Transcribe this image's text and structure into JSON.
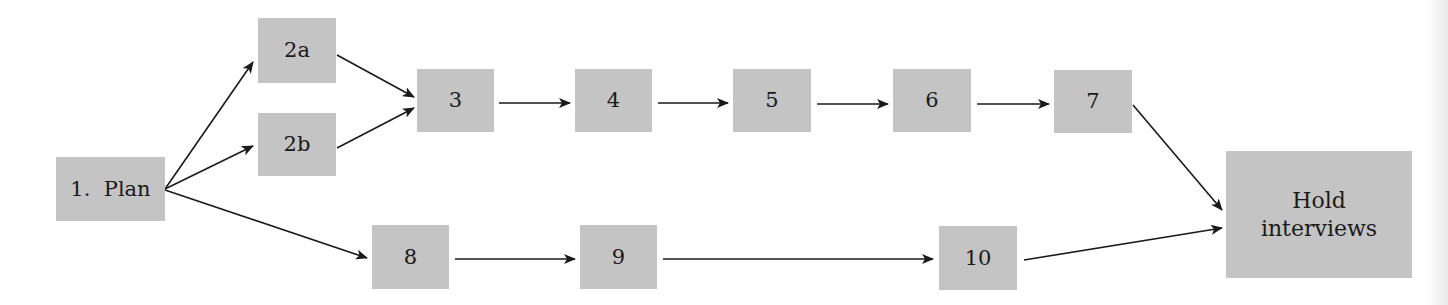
{
  "diagram": {
    "type": "flowchart",
    "nodes": [
      {
        "id": "plan",
        "label": "1.  Plan",
        "x": 56,
        "y": 157,
        "w": 109,
        "h": 64
      },
      {
        "id": "2a",
        "label": "2a",
        "x": 258,
        "y": 18,
        "w": 78,
        "h": 65
      },
      {
        "id": "2b",
        "label": "2b",
        "x": 258,
        "y": 113,
        "w": 78,
        "h": 63
      },
      {
        "id": "3",
        "label": "3",
        "x": 417,
        "y": 69,
        "w": 77,
        "h": 63
      },
      {
        "id": "4",
        "label": "4",
        "x": 575,
        "y": 69,
        "w": 77,
        "h": 63
      },
      {
        "id": "5",
        "label": "5",
        "x": 733,
        "y": 69,
        "w": 78,
        "h": 63
      },
      {
        "id": "6",
        "label": "6",
        "x": 893,
        "y": 69,
        "w": 78,
        "h": 63
      },
      {
        "id": "7",
        "label": "7",
        "x": 1054,
        "y": 70,
        "w": 78,
        "h": 63
      },
      {
        "id": "hold",
        "label_line1": "Hold",
        "label_line2": "interviews",
        "x": 1226,
        "y": 151,
        "w": 186,
        "h": 127
      },
      {
        "id": "8",
        "label": "8",
        "x": 372,
        "y": 225,
        "w": 77,
        "h": 64
      },
      {
        "id": "9",
        "label": "9",
        "x": 580,
        "y": 225,
        "w": 77,
        "h": 64
      },
      {
        "id": "10",
        "label": "10",
        "x": 939,
        "y": 226,
        "w": 78,
        "h": 64
      }
    ],
    "edges": [
      {
        "from": "plan",
        "to": "2a",
        "x1": 165,
        "y1": 189,
        "x2": 253,
        "y2": 62
      },
      {
        "from": "plan",
        "to": "2b",
        "x1": 165,
        "y1": 189,
        "x2": 253,
        "y2": 146
      },
      {
        "from": "plan",
        "to": "8",
        "x1": 165,
        "y1": 190,
        "x2": 367,
        "y2": 258
      },
      {
        "from": "2a",
        "to": "3",
        "x1": 337,
        "y1": 55,
        "x2": 414,
        "y2": 97
      },
      {
        "from": "2b",
        "to": "3",
        "x1": 337,
        "y1": 148,
        "x2": 414,
        "y2": 108
      },
      {
        "from": "3",
        "to": "4",
        "x1": 499,
        "y1": 103,
        "x2": 570,
        "y2": 103
      },
      {
        "from": "4",
        "to": "5",
        "x1": 658,
        "y1": 103,
        "x2": 728,
        "y2": 103
      },
      {
        "from": "5",
        "to": "6",
        "x1": 817,
        "y1": 104,
        "x2": 888,
        "y2": 104
      },
      {
        "from": "6",
        "to": "7",
        "x1": 977,
        "y1": 104,
        "x2": 1049,
        "y2": 104
      },
      {
        "from": "7",
        "to": "hold",
        "x1": 1133,
        "y1": 105,
        "x2": 1222,
        "y2": 210
      },
      {
        "from": "8",
        "to": "9",
        "x1": 455,
        "y1": 259,
        "x2": 575,
        "y2": 259
      },
      {
        "from": "9",
        "to": "10",
        "x1": 663,
        "y1": 259,
        "x2": 933,
        "y2": 259
      },
      {
        "from": "10",
        "to": "hold",
        "x1": 1024,
        "y1": 260,
        "x2": 1222,
        "y2": 228
      }
    ],
    "colors": {
      "node_fill": "#c4c4c4",
      "edge": "#1a1a1a",
      "text": "#1a1a1a"
    }
  }
}
